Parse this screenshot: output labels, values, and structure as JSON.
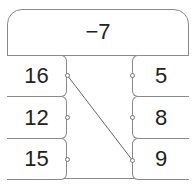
{
  "header": {
    "value": "−7"
  },
  "left_column": [
    {
      "value": "16"
    },
    {
      "value": "12"
    },
    {
      "value": "15"
    }
  ],
  "right_column": [
    {
      "value": "5"
    },
    {
      "value": "8"
    },
    {
      "value": "9"
    }
  ],
  "connections": [
    {
      "from": "16",
      "to": "9"
    }
  ]
}
